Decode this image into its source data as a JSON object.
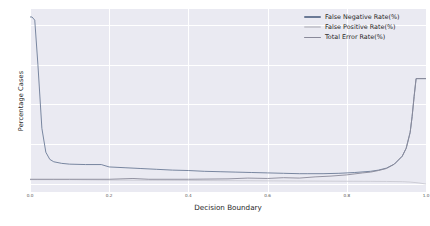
{
  "chart_data": {
    "type": "line",
    "title": "",
    "xlabel": "Decision Boundary",
    "ylabel": "Percentage Cases",
    "xlim": [
      0.0,
      1.0
    ],
    "ylim": [
      -2,
      44
    ],
    "grid": true,
    "legend_position": "upper right",
    "xticks": [
      "0.0",
      "0.2",
      "0.4",
      "0.6",
      "0.8",
      "1.0"
    ],
    "xtick_values": [
      0.0,
      0.2,
      0.4,
      0.6,
      0.8,
      1.0
    ],
    "yticks": [
      "0",
      "10",
      "20",
      "30",
      "40"
    ],
    "ytick_values": [
      0,
      10,
      20,
      30,
      40
    ],
    "colors": {
      "false_negative": "#4c72b0",
      "false_positive": "#c8c8d0",
      "total_error": "#808090"
    },
    "series": [
      {
        "name": "False Negative Rate(%)",
        "color": "#6b7a96",
        "x": [
          0.0,
          0.005,
          0.012,
          0.02,
          0.03,
          0.04,
          0.05,
          0.06,
          0.08,
          0.1,
          0.14,
          0.18,
          0.2,
          0.24,
          0.28,
          0.32,
          0.36,
          0.4,
          0.44,
          0.48,
          0.52,
          0.56,
          0.6,
          0.64,
          0.68,
          0.7,
          0.74,
          0.78,
          0.82,
          0.86,
          0.88,
          0.9,
          0.92,
          0.94,
          0.95,
          0.96,
          0.965,
          0.97,
          0.975,
          1.0
        ],
        "values": [
          42.0,
          42.0,
          41.2,
          30.0,
          14.0,
          8.0,
          6.2,
          5.6,
          5.2,
          5.0,
          4.9,
          4.9,
          4.3,
          4.1,
          3.9,
          3.7,
          3.5,
          3.4,
          3.2,
          3.1,
          3.0,
          2.9,
          2.8,
          2.7,
          2.6,
          2.6,
          2.6,
          2.7,
          2.9,
          3.2,
          3.5,
          4.0,
          5.0,
          7.0,
          9.0,
          13.0,
          17.0,
          22.0,
          26.5,
          26.5
        ]
      },
      {
        "name": "False Positive Rate(%)",
        "color": "#c9c9d2",
        "x": [
          0.0,
          0.05,
          0.1,
          0.2,
          0.3,
          0.4,
          0.5,
          0.6,
          0.7,
          0.8,
          0.86,
          0.9,
          0.94,
          0.96,
          0.98,
          1.0
        ],
        "values": [
          1.1,
          1.1,
          1.1,
          1.0,
          0.95,
          0.9,
          0.85,
          0.8,
          0.75,
          0.7,
          0.68,
          0.65,
          0.6,
          0.5,
          0.3,
          0.0
        ]
      },
      {
        "name": "Total Error Rate(%)",
        "color": "#8a8a9a",
        "x": [
          0.0,
          0.02,
          0.06,
          0.1,
          0.2,
          0.26,
          0.3,
          0.4,
          0.5,
          0.55,
          0.6,
          0.64,
          0.68,
          0.72,
          0.76,
          0.8,
          0.84,
          0.86,
          0.88,
          0.9,
          0.92,
          0.94,
          0.95,
          0.96,
          0.965,
          0.97,
          0.975,
          1.0
        ],
        "values": [
          1.2,
          1.2,
          1.2,
          1.2,
          1.2,
          1.4,
          1.2,
          1.2,
          1.3,
          1.5,
          1.4,
          1.6,
          1.5,
          1.8,
          2.0,
          2.3,
          2.8,
          3.0,
          3.4,
          3.9,
          5.0,
          7.0,
          9.0,
          13.0,
          17.0,
          22.0,
          26.5,
          26.5
        ]
      }
    ]
  },
  "legend": {
    "items": [
      {
        "label": "False Negative Rate(%)",
        "color": "#6b7a96"
      },
      {
        "label": "False Positive Rate(%)",
        "color": "#c9c9d2"
      },
      {
        "label": "Total Error Rate(%)",
        "color": "#8a8a9a"
      }
    ]
  }
}
